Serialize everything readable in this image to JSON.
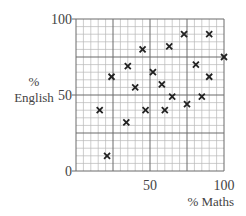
{
  "chart_data": {
    "type": "scatter",
    "title": "",
    "xlabel": "% Maths",
    "ylabel_line1": "%",
    "ylabel_line2": "English",
    "xlim": [
      0,
      100
    ],
    "ylim": [
      0,
      100
    ],
    "x_ticks": [
      0,
      50,
      100
    ],
    "x_tick_labels": [
      "50",
      "100"
    ],
    "y_ticks": [
      0,
      50,
      100
    ],
    "y_tick_labels": [
      "0",
      "50",
      "100"
    ],
    "grid": {
      "minor_step": 5,
      "major_step": 25
    },
    "marker": "x",
    "legend": null,
    "points": [
      {
        "x": 16,
        "y": 40
      },
      {
        "x": 21,
        "y": 10
      },
      {
        "x": 24,
        "y": 62
      },
      {
        "x": 34,
        "y": 32
      },
      {
        "x": 35,
        "y": 69
      },
      {
        "x": 40,
        "y": 55
      },
      {
        "x": 45,
        "y": 80
      },
      {
        "x": 47,
        "y": 40
      },
      {
        "x": 52,
        "y": 65
      },
      {
        "x": 58,
        "y": 57
      },
      {
        "x": 60,
        "y": 40
      },
      {
        "x": 63,
        "y": 82
      },
      {
        "x": 65,
        "y": 49
      },
      {
        "x": 73,
        "y": 90
      },
      {
        "x": 75,
        "y": 44
      },
      {
        "x": 81,
        "y": 70
      },
      {
        "x": 85,
        "y": 49
      },
      {
        "x": 90,
        "y": 90
      },
      {
        "x": 90,
        "y": 62
      },
      {
        "x": 100,
        "y": 75
      }
    ]
  },
  "colors": {
    "minor_grid": "#b8b8b8",
    "major_grid": "#6a6a6a",
    "marker": "#222222",
    "text": "#444444"
  }
}
